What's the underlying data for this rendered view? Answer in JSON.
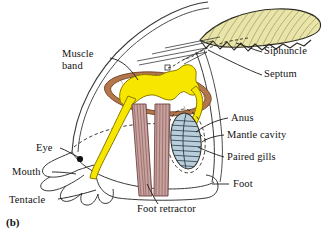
{
  "figure": {
    "caption": "(b)",
    "background": "#ffffff"
  },
  "colors": {
    "shell": "#e9e5a9",
    "shell_outline": "#2b2a20",
    "digestive_yellow": "#f7e600",
    "muscle_band_brown": "#b4764b",
    "gill_blue": "#b9cedb",
    "retractor_pink": "#c8a3a0",
    "ink": "#1a1a1a"
  },
  "labels": [
    {
      "id": "muscle-band",
      "text": "Muscle\nband",
      "x": 62,
      "y": 54,
      "align": "left"
    },
    {
      "id": "siphuncle",
      "text": "Siphuncle",
      "x": 264,
      "y": 50,
      "align": "left"
    },
    {
      "id": "septum",
      "text": "Septum",
      "x": 264,
      "y": 73,
      "align": "left"
    },
    {
      "id": "anus",
      "text": "Anus",
      "x": 230,
      "y": 117,
      "align": "left"
    },
    {
      "id": "mantle-cavity",
      "text": "Mantle cavity",
      "x": 226,
      "y": 133,
      "align": "left"
    },
    {
      "id": "paired-gills",
      "text": "Paired gills",
      "x": 226,
      "y": 155,
      "align": "left"
    },
    {
      "id": "eye",
      "text": "Eye",
      "x": 41,
      "y": 146,
      "align": "left"
    },
    {
      "id": "mouth",
      "text": "Mouth",
      "x": 18,
      "y": 170,
      "align": "left"
    },
    {
      "id": "tentacle",
      "text": "Tentacle",
      "x": 14,
      "y": 198,
      "align": "left"
    },
    {
      "id": "foot",
      "text": "Foot",
      "x": 231,
      "y": 182,
      "align": "left"
    },
    {
      "id": "foot-retractor",
      "text": "Foot retractor",
      "x": 138,
      "y": 206,
      "align": "left"
    }
  ],
  "structures": [
    {
      "id": "shell",
      "name": "Shell"
    },
    {
      "id": "septa",
      "name": "Septum"
    },
    {
      "id": "siphuncle-tube",
      "name": "Siphuncle"
    },
    {
      "id": "muscle-band",
      "name": "Muscle band"
    },
    {
      "id": "digestive-tract",
      "name": "Digestive tract"
    },
    {
      "id": "gill",
      "name": "Paired gills"
    },
    {
      "id": "mantle-cavity",
      "name": "Mantle cavity"
    },
    {
      "id": "foot-retractor",
      "name": "Foot retractor"
    },
    {
      "id": "head-tentacles",
      "name": "Tentacle"
    },
    {
      "id": "eye-dot",
      "name": "Eye"
    },
    {
      "id": "foot",
      "name": "Foot"
    }
  ]
}
